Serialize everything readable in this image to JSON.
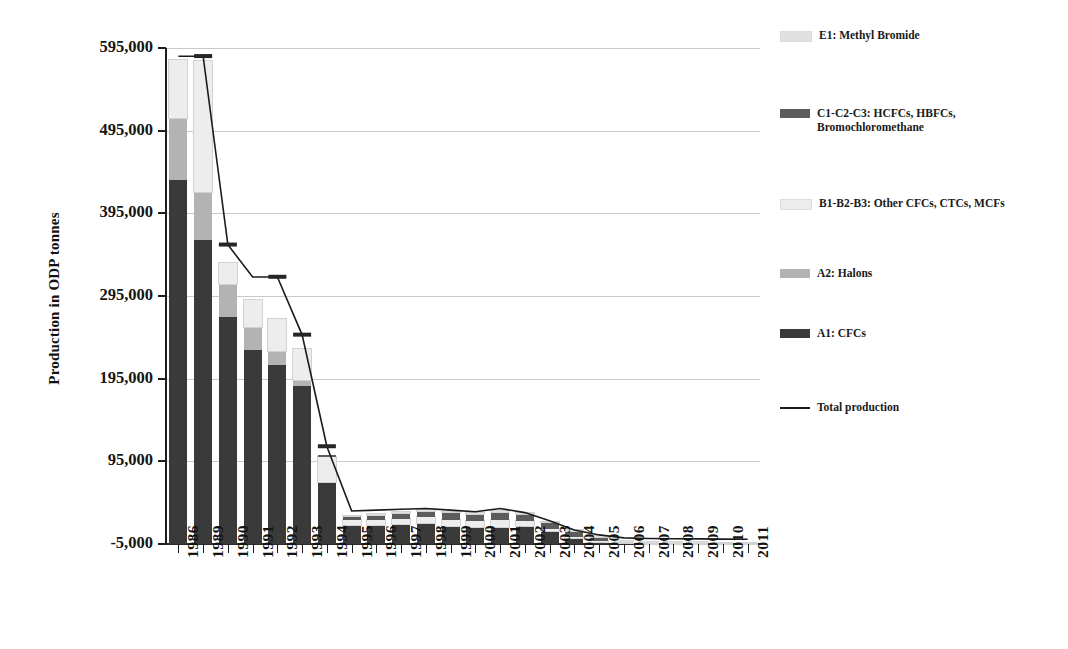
{
  "chart_data": {
    "type": "bar",
    "subtype": "stacked-bar-with-line",
    "title": "",
    "xlabel": "",
    "ylabel": "Production in ODP tonnes",
    "ylim": [
      -5000,
      595000
    ],
    "yticks": [
      -5000,
      95000,
      195000,
      295000,
      395000,
      495000,
      595000
    ],
    "ytick_labels": [
      "-5,000",
      "95,000",
      "195,000",
      "295,000",
      "395,000",
      "495,000",
      "595,000"
    ],
    "grid": true,
    "legend_position": "right",
    "categories": [
      "1986",
      "1989",
      "1990",
      "1991",
      "1992",
      "1993",
      "1994",
      "1995",
      "1996",
      "1997",
      "1998",
      "1999",
      "2000",
      "2001",
      "2002",
      "2003",
      "2004",
      "2005",
      "2006",
      "2007",
      "2008",
      "2009",
      "2010",
      "2011"
    ],
    "series": [
      {
        "name": "A1: CFCs",
        "color": "#3a3a3a",
        "values": [
          440000,
          368000,
          275000,
          235000,
          216000,
          191000,
          74000,
          22000,
          23000,
          24000,
          25000,
          22000,
          20000,
          20000,
          22000,
          15000,
          7000,
          2500,
          900,
          500,
          400,
          300,
          200,
          150
        ]
      },
      {
        "name": "A2: Halons",
        "color": "#b3b3b3",
        "values": [
          75000,
          58000,
          40000,
          28000,
          18000,
          7000,
          1500,
          500,
          400,
          400,
          400,
          300,
          300,
          300,
          300,
          200,
          100,
          50,
          30,
          20,
          20,
          20,
          10,
          10
        ]
      },
      {
        "name": "B1-B2-B3: Other CFCs, CTCs, MCFs",
        "color": "#ededed",
        "values": [
          70000,
          158000,
          25000,
          32000,
          38000,
          38000,
          30000,
          6000,
          6000,
          6000,
          7000,
          7000,
          7000,
          9000,
          5000,
          3000,
          1500,
          500,
          200,
          150,
          120,
          100,
          60,
          50
        ]
      },
      {
        "name": "C1-C2-C3: HCFCs, HBFCs, Bromochloromethane",
        "color": "#5c5c5c",
        "values": [
          0,
          0,
          0,
          0,
          0,
          0,
          2000,
          5000,
          6000,
          7000,
          8000,
          9000,
          9000,
          10000,
          9000,
          8000,
          7000,
          6000,
          1200,
          900,
          900,
          800,
          700,
          600
        ]
      },
      {
        "name": "E1: Methyl Bromide",
        "color": "#e0e0e0",
        "values": [
          0,
          0,
          0,
          0,
          0,
          0,
          0,
          1000,
          1000,
          1000,
          1000,
          1000,
          1000,
          1000,
          1000,
          800,
          400,
          200,
          100,
          80,
          60,
          50,
          40,
          30
        ]
      }
    ],
    "line_series": {
      "name": "Total production",
      "color": "#1b1b1b",
      "values": [
        585000,
        585000,
        357000,
        318000,
        318000,
        248000,
        113000,
        35000,
        36000,
        37000,
        38000,
        36000,
        34000,
        38000,
        33000,
        23000,
        12000,
        6000,
        2400,
        1600,
        1400,
        1200,
        950,
        800
      ]
    },
    "markers": [
      {
        "category": "1989",
        "value": 585000
      },
      {
        "category": "1990",
        "value": 357000
      },
      {
        "category": "1992",
        "value": 318000
      },
      {
        "category": "1993",
        "value": 248000
      },
      {
        "category": "1994",
        "value": 113000
      }
    ]
  },
  "legend": {
    "items": [
      {
        "label": "E1: Methyl Bromide",
        "swatch": "#e0e0e0",
        "kind": "swatch"
      },
      {
        "label": "C1-C2-C3: HCFCs, HBFCs, Bromochloromethane",
        "swatch": "#5c5c5c",
        "kind": "swatch"
      },
      {
        "label": "B1-B2-B3: Other CFCs, CTCs, MCFs",
        "swatch": "#ededed",
        "kind": "swatch"
      },
      {
        "label": "A2: Halons",
        "swatch": "#b3b3b3",
        "kind": "swatch"
      },
      {
        "label": "A1: CFCs",
        "swatch": "#3a3a3a",
        "kind": "swatch"
      },
      {
        "label": "Total production",
        "swatch": "#1b1b1b",
        "kind": "line"
      }
    ]
  },
  "axis": {
    "y_title": "Production in ODP tonnes"
  }
}
